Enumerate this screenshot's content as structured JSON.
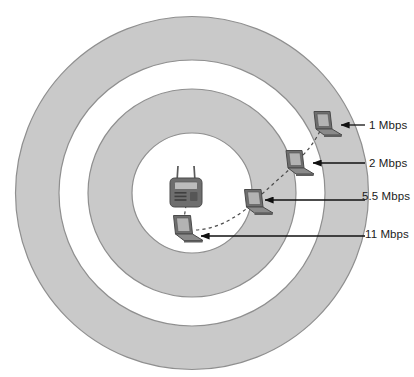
{
  "diagram": {
    "colors": {
      "ring_fill": "#c9c9c9",
      "inner_fill": "#ffffff",
      "outline": "#8f8f8f",
      "device_body": "#6e6e6e",
      "device_dark": "#4a4a4a",
      "screen": "#b3b3b3",
      "arrow": "#111111",
      "dashed_link": "#4a4a4a",
      "text": "#1b1b1b",
      "page_background": "#ffffff"
    },
    "center_device": {
      "name": "wireless-access-point",
      "antenna_count": 2
    },
    "zones": [
      {
        "rate": "1 Mbps",
        "ring": "outer",
        "outer_radius": 177,
        "inner_radius": 133
      },
      {
        "rate": "2 Mbps",
        "ring": "middle",
        "outer_radius": 104,
        "inner_radius": 60
      },
      {
        "rate": "5.5 Mbps",
        "ring": "middle",
        "outer_radius": 104,
        "inner_radius": 60
      },
      {
        "rate": "11 Mbps",
        "ring": "inner",
        "outer_radius": 60,
        "inner_radius": 0
      }
    ],
    "labels": [
      {
        "id": "label-1mbps",
        "text": "1 Mbps"
      },
      {
        "id": "label-2mbps",
        "text": "2 Mbps"
      },
      {
        "id": "label-55mbps",
        "text": "5.5 Mbps"
      },
      {
        "id": "label-11mbps",
        "text": "11 Mbps"
      }
    ],
    "clients": [
      {
        "id": "client-1mbps",
        "rate": "1 Mbps",
        "x": 325,
        "y": 122
      },
      {
        "id": "client-2mbps",
        "rate": "2 Mbps",
        "x": 297,
        "y": 161
      },
      {
        "id": "client-55mbps",
        "rate": "5.5 Mbps",
        "x": 256,
        "y": 200
      },
      {
        "id": "client-11mbps",
        "rate": "11 Mbps",
        "x": 186,
        "y": 227
      }
    ]
  }
}
